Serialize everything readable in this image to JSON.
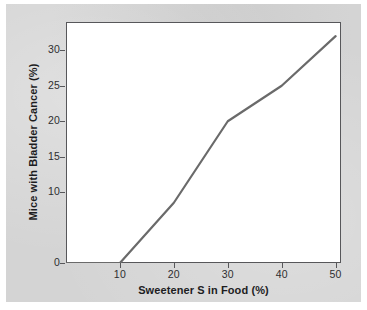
{
  "figure": {
    "background_color": "#d4d4d4",
    "plot_background_color": "#ffffff",
    "frame_color": "#57575a",
    "line_color": "#6a6a6a"
  },
  "chart_data": {
    "type": "line",
    "title": "",
    "xlabel": "Sweetener S in Food (%)",
    "ylabel": "Mice with Bladder Cancer (%)",
    "xlim": [
      0,
      51
    ],
    "ylim": [
      0,
      34
    ],
    "grid": false,
    "legend": false,
    "xticks": [
      10,
      20,
      30,
      40,
      50
    ],
    "xtick_labels": [
      "10",
      "20",
      "30",
      "40",
      "50"
    ],
    "yticks": [
      0,
      10,
      15,
      20,
      25,
      30
    ],
    "ytick_labels": [
      "0",
      "10",
      "15",
      "20",
      "25",
      "30"
    ],
    "series": [
      {
        "name": "Mice with Bladder Cancer",
        "color": "#6a6a6a",
        "x": [
          0,
          10,
          20,
          30,
          40,
          50
        ],
        "values": [
          0,
          0,
          8.5,
          20,
          25,
          32
        ]
      }
    ]
  }
}
